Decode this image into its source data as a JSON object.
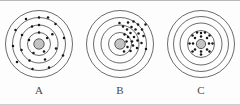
{
  "figure": {
    "background_color": "#fdfdfd",
    "shell_color": "#3a3a3a",
    "electron_color": "#161616",
    "nucleus_fill": "#c9c9c9",
    "caption_color": "#4a4a4a"
  },
  "diagrams": [
    {
      "id": "a",
      "label": "A",
      "center": {
        "cx": 37,
        "cy": 37
      },
      "nucleus": {
        "r": 5.2,
        "hatch": true
      },
      "shells": [
        {
          "r": 11.5
        },
        {
          "r": 19.0
        },
        {
          "r": 26.5
        },
        {
          "r": 33.5
        }
      ],
      "electron_radius": 1.25,
      "electron_count": 24,
      "distribution": "even",
      "electrons": [
        {
          "x": 37.0,
          "y": 25.5
        },
        {
          "x": 45.1,
          "y": 31.1
        },
        {
          "x": 42.0,
          "y": 44.5
        },
        {
          "x": 31.5,
          "y": 46.0
        },
        {
          "x": 27.0,
          "y": 33.0
        },
        {
          "x": 37.0,
          "y": 18.0
        },
        {
          "x": 50.3,
          "y": 27.3
        },
        {
          "x": 54.0,
          "y": 41.5
        },
        {
          "x": 43.0,
          "y": 52.5
        },
        {
          "x": 27.5,
          "y": 53.5
        },
        {
          "x": 19.5,
          "y": 43.0
        },
        {
          "x": 20.0,
          "y": 28.0
        },
        {
          "x": 30.0,
          "y": 19.5
        },
        {
          "x": 37.0,
          "y": 10.5
        },
        {
          "x": 53.5,
          "y": 17.0
        },
        {
          "x": 62.0,
          "y": 31.0
        },
        {
          "x": 61.0,
          "y": 48.5
        },
        {
          "x": 47.0,
          "y": 60.5
        },
        {
          "x": 30.5,
          "y": 62.0
        },
        {
          "x": 15.0,
          "y": 55.0
        },
        {
          "x": 11.0,
          "y": 39.0
        },
        {
          "x": 13.5,
          "y": 23.0
        },
        {
          "x": 24.0,
          "y": 12.0
        },
        {
          "x": 46.0,
          "y": 10.5
        }
      ]
    },
    {
      "id": "b",
      "label": "B",
      "center": {
        "cx": 37,
        "cy": 37
      },
      "nucleus": {
        "r": 5.2,
        "hatch": true
      },
      "shells": [
        {
          "r": 11.5
        },
        {
          "r": 19.0
        },
        {
          "r": 26.5
        },
        {
          "r": 33.5
        }
      ],
      "electron_radius": 1.25,
      "electron_count": 26,
      "distribution": "clustered-upper-right",
      "electrons": [
        {
          "x": 43.5,
          "y": 34.5
        },
        {
          "x": 45.0,
          "y": 30.0
        },
        {
          "x": 41.5,
          "y": 27.5
        },
        {
          "x": 47.5,
          "y": 26.0
        },
        {
          "x": 51.0,
          "y": 30.0
        },
        {
          "x": 49.0,
          "y": 34.5
        },
        {
          "x": 44.0,
          "y": 22.5
        },
        {
          "x": 48.5,
          "y": 20.0
        },
        {
          "x": 52.5,
          "y": 22.5
        },
        {
          "x": 55.5,
          "y": 26.5
        },
        {
          "x": 54.5,
          "y": 33.5
        },
        {
          "x": 50.0,
          "y": 38.5
        },
        {
          "x": 44.5,
          "y": 40.0
        },
        {
          "x": 40.0,
          "y": 19.5
        },
        {
          "x": 45.0,
          "y": 15.5
        },
        {
          "x": 50.5,
          "y": 14.5
        },
        {
          "x": 55.0,
          "y": 17.5
        },
        {
          "x": 59.0,
          "y": 22.5
        },
        {
          "x": 60.5,
          "y": 29.0
        },
        {
          "x": 58.5,
          "y": 36.0
        },
        {
          "x": 54.0,
          "y": 41.0
        },
        {
          "x": 47.5,
          "y": 44.0
        },
        {
          "x": 41.0,
          "y": 44.5
        },
        {
          "x": 36.5,
          "y": 16.0
        },
        {
          "x": 62.5,
          "y": 17.5
        },
        {
          "x": 63.0,
          "y": 42.0
        }
      ]
    },
    {
      "id": "c",
      "label": "C",
      "center": {
        "cx": 37,
        "cy": 37
      },
      "nucleus": {
        "r": 4.6,
        "hatch": true
      },
      "shells": [
        {
          "r": 13.5
        },
        {
          "r": 21.0
        },
        {
          "r": 27.5
        },
        {
          "r": 33.5
        }
      ],
      "electron_radius": 1.25,
      "electron_count": 18,
      "distribution": "packed-inner-shell",
      "electrons": [
        {
          "x": 37.0,
          "y": 29.5
        },
        {
          "x": 43.0,
          "y": 31.0
        },
        {
          "x": 45.0,
          "y": 36.5
        },
        {
          "x": 43.0,
          "y": 42.5
        },
        {
          "x": 37.0,
          "y": 44.5
        },
        {
          "x": 31.0,
          "y": 42.5
        },
        {
          "x": 29.0,
          "y": 36.5
        },
        {
          "x": 31.0,
          "y": 31.0
        },
        {
          "x": 37.0,
          "y": 26.0
        },
        {
          "x": 45.5,
          "y": 28.5
        },
        {
          "x": 48.5,
          "y": 36.5
        },
        {
          "x": 45.5,
          "y": 44.5
        },
        {
          "x": 37.0,
          "y": 47.5
        },
        {
          "x": 28.5,
          "y": 44.5
        },
        {
          "x": 25.5,
          "y": 36.5
        },
        {
          "x": 28.5,
          "y": 28.5
        },
        {
          "x": 33.0,
          "y": 25.5
        },
        {
          "x": 41.0,
          "y": 25.5
        }
      ]
    }
  ]
}
